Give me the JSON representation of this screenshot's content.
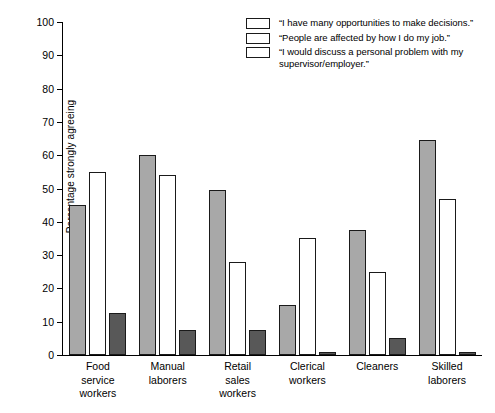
{
  "chart_data": {
    "type": "bar",
    "title": "",
    "xlabel": "",
    "ylabel": "Percentage strongly agreeing",
    "ylim": [
      0,
      100
    ],
    "yticks": [
      0,
      10,
      20,
      30,
      40,
      50,
      60,
      70,
      80,
      90,
      100
    ],
    "grid": false,
    "legend_position": "top-right",
    "categories": [
      "Food\nservice\nworkers",
      "Manual\nlaborers",
      "Retail\nsales\nworkers",
      "Clerical\nworkers",
      "Cleaners",
      "Skilled\nlaborers"
    ],
    "series": [
      {
        "name": "“I have many opportunities to make decisions.”",
        "color": "#a8a8a8",
        "values": [
          45,
          60,
          49.5,
          15,
          37.5,
          64.5
        ]
      },
      {
        "name": "“People are affected by how I do my job.”",
        "color": "#ffffff",
        "values": [
          55,
          54,
          28,
          35,
          25,
          47
        ]
      },
      {
        "name": "“I would discuss a personal problem with my\n    supervisor/employer.”",
        "color": "#585858",
        "values": [
          12.5,
          7.5,
          7.5,
          1,
          5,
          1
        ]
      }
    ]
  }
}
